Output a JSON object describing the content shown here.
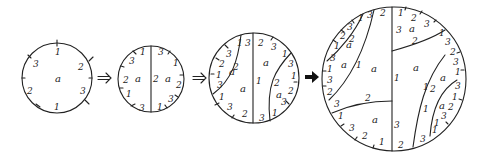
{
  "diagram": {
    "stroke_color": "#222222",
    "background": "#ffffff",
    "arrows": [
      {
        "from": "disk-1",
        "to": "disk-2",
        "style": "double"
      },
      {
        "from": "disk-2",
        "to": "disk-3",
        "style": "double"
      },
      {
        "from": "disk-3",
        "to": "disk-4",
        "style": "bold"
      }
    ],
    "disks": [
      {
        "id": "disk-1",
        "face_labels": [
          "a"
        ],
        "edge_labels": [
          "1",
          "2",
          "3",
          "1",
          "2",
          "3"
        ]
      },
      {
        "id": "disk-2",
        "face_labels": [
          "a",
          "a"
        ],
        "interior_edge_labels": [
          "2"
        ],
        "edge_labels": [
          "1",
          "3",
          "2",
          "1",
          "3",
          "3",
          "1",
          "2",
          "3",
          "1"
        ]
      },
      {
        "id": "disk-3",
        "face_labels": [
          "a",
          "a",
          "a",
          "a"
        ],
        "interior_edge_labels": [
          "1",
          "2",
          "2",
          "2",
          "1"
        ],
        "edge_labels": [
          "1",
          "3",
          "2",
          "3",
          "1",
          "3",
          "1",
          "3",
          "2",
          "1",
          "3",
          "2",
          "3",
          "1",
          "3",
          "2",
          "3",
          "1"
        ]
      },
      {
        "id": "disk-4",
        "face_labels": [
          "a",
          "a",
          "a",
          "a",
          "a",
          "a",
          "a",
          "a"
        ],
        "interior_edge_labels": [
          "2",
          "1",
          "1",
          "2",
          "3",
          "2",
          "1",
          "3",
          "1",
          "2"
        ],
        "edge_labels": [
          "3",
          "2",
          "1",
          "2",
          "3",
          "1",
          "3",
          "2",
          "3",
          "1",
          "3",
          "1",
          "3",
          "1",
          "2",
          "3",
          "1",
          "3",
          "2",
          "1",
          "2",
          "3",
          "1",
          "2",
          "3"
        ]
      }
    ]
  },
  "labels": {
    "d1": {
      "face": "a",
      "e1": "1",
      "e2": "2",
      "e3": "3",
      "e4": "1",
      "e5": "2",
      "e6": "3"
    },
    "d2": {
      "fl": "a",
      "fr": "a",
      "mid": "2",
      "l1": "1",
      "l2": "3",
      "l3": "2",
      "l4": "1",
      "l5": "3",
      "r1": "3",
      "r2": "1",
      "r3": "2",
      "r4": "3",
      "r5": "1"
    },
    "d3": {
      "f1": "a",
      "f2": "a",
      "f3": "a",
      "f4": "a",
      "mid": "1",
      "t1": "1",
      "t2": "3",
      "t3": "2",
      "t4": "3",
      "t5": "1",
      "l1": "3",
      "l2": "2",
      "l3": "1",
      "l4": "3",
      "l5": "2",
      "b1": "1",
      "b2": "3",
      "b3": "2",
      "b4": "3",
      "r1": "3",
      "r2": "1",
      "r3": "2",
      "r4": "3",
      "r5": "1",
      "i1": "2",
      "i2": "2"
    },
    "d4": {
      "f1": "a",
      "f2": "a",
      "f3": "a",
      "f4": "a",
      "f5": "a",
      "f6": "a",
      "f7": "a",
      "f8": "a",
      "t1": "3",
      "t2": "2",
      "t3": "1",
      "t4": "2",
      "t5": "3",
      "t6": "1",
      "t7": "3",
      "tl1": "1",
      "tl2": "3",
      "tl3": "2",
      "tl4": "1",
      "tl5": "2",
      "tl6": "3",
      "l1": "1",
      "l2": "3",
      "l3": "2",
      "l4": "3",
      "l5": "1",
      "b1": "3",
      "b2": "2",
      "b3": "1",
      "b4": "2",
      "b5": "3",
      "b6": "1",
      "r1": "2",
      "r2": "3",
      "r3": "1",
      "r4": "3",
      "r5": "1",
      "r6": "2",
      "r7": "3",
      "r8": "1",
      "m1": "3",
      "m2": "2",
      "m3": "1",
      "m4": "1",
      "m5": "3",
      "m6": "2",
      "m7": "1",
      "m8": "2",
      "m9": "1"
    }
  }
}
